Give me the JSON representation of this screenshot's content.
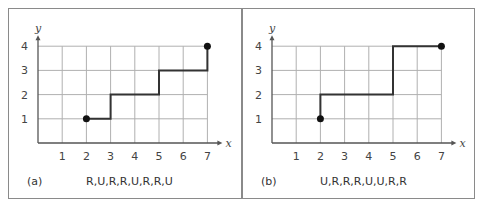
{
  "figure": {
    "panels": [
      {
        "id": "a",
        "label": "(a)",
        "sequence": "R,U,R,R,U,R,R,U",
        "x_axis_label": "x",
        "y_axis_label": "y",
        "x_ticks": [
          "1",
          "2",
          "3",
          "4",
          "5",
          "6",
          "7"
        ],
        "y_ticks": [
          "1",
          "2",
          "3",
          "4"
        ],
        "start": [
          2,
          1
        ],
        "end": [
          7,
          4
        ],
        "path": [
          [
            2,
            1
          ],
          [
            3,
            1
          ],
          [
            3,
            2
          ],
          [
            5,
            2
          ],
          [
            5,
            3
          ],
          [
            7,
            3
          ],
          [
            7,
            4
          ]
        ]
      },
      {
        "id": "b",
        "label": "(b)",
        "sequence": "U,R,R,R,U,U,R,R",
        "x_axis_label": "x",
        "y_axis_label": "y",
        "x_ticks": [
          "1",
          "2",
          "3",
          "4",
          "5",
          "6",
          "7"
        ],
        "y_ticks": [
          "1",
          "2",
          "3",
          "4"
        ],
        "start": [
          2,
          1
        ],
        "end": [
          7,
          4
        ],
        "path": [
          [
            2,
            1
          ],
          [
            2,
            2
          ],
          [
            5,
            2
          ],
          [
            5,
            4
          ],
          [
            7,
            4
          ]
        ]
      }
    ]
  }
}
